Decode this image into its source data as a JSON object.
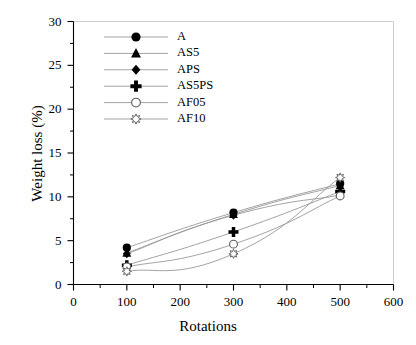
{
  "chart_data": {
    "type": "line",
    "title": "",
    "subtitle": "",
    "xlabel": "Rotations",
    "ylabel": "Weight loss (%)",
    "xlim": [
      0,
      600
    ],
    "ylim": [
      0,
      30
    ],
    "x": [
      100,
      300,
      500
    ],
    "xticks": [
      0,
      100,
      200,
      300,
      400,
      500,
      600
    ],
    "xtick_labels": [
      "0",
      "100",
      "200",
      "300",
      "400",
      "500",
      "600"
    ],
    "x_minor_ticks": [
      50,
      150,
      250,
      350,
      450,
      550
    ],
    "yticks": [
      0,
      5,
      10,
      15,
      20,
      25,
      30
    ],
    "ytick_labels": [
      "0",
      "5",
      "10",
      "15",
      "20",
      "25",
      "30"
    ],
    "y_minor_ticks": [
      2.5,
      7.5,
      12.5,
      17.5,
      22.5,
      27.5
    ],
    "grid": false,
    "legend_position": "upper-left-inside",
    "line_color": "#999999",
    "marker_color": "#000000",
    "series": [
      {
        "name": "A",
        "marker": "filled-circle",
        "values": [
          4.2,
          8.2,
          11.5
        ]
      },
      {
        "name": "AS5",
        "marker": "filled-triangle",
        "values": [
          3.6,
          8.0,
          11.3
        ]
      },
      {
        "name": "APS",
        "marker": "filled-diamond",
        "values": [
          3.5,
          7.9,
          10.2
        ]
      },
      {
        "name": "AS5PS",
        "marker": "bold-plus",
        "values": [
          2.2,
          6.0,
          10.6
        ]
      },
      {
        "name": "AF05",
        "marker": "open-circle",
        "values": [
          2.0,
          4.6,
          10.1
        ]
      },
      {
        "name": "AF10",
        "marker": "open-star",
        "values": [
          1.5,
          3.5,
          12.2
        ]
      }
    ]
  }
}
